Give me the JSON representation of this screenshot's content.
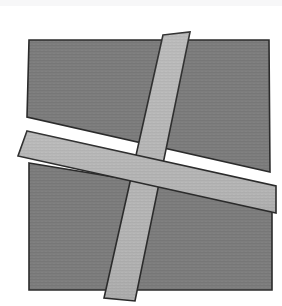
{
  "figure": {
    "canvas": {
      "width": 282,
      "height": 306,
      "background": "#ffffff"
    },
    "palette": {
      "background": "#ffffff",
      "panel_fill": "#7d7d7d",
      "panel_texture_line": "#747474",
      "band_fill": "#b4b4b4",
      "band_texture_line": "#aaaaaa",
      "outline": "#2b2b2b",
      "top_edge_artifact": "#f7f7f8"
    },
    "stroke_width": 1.6,
    "shapes": [
      {
        "name": "upper-panel",
        "role": "dark-quadrilateral",
        "fill": "#7d7d7d",
        "stroke": "#2b2b2b",
        "points": "29,40 269,40 270,172 27,117"
      },
      {
        "name": "lower-panel",
        "role": "dark-quadrilateral",
        "fill": "#7d7d7d",
        "stroke": "#2b2b2b",
        "points": "29,163 272,203 272,290 29,290"
      },
      {
        "name": "vertical-band",
        "role": "light-strip",
        "fill": "#b4b4b4",
        "stroke": "#2b2b2b",
        "points": "163,35 190,32 135,301 104,298"
      },
      {
        "name": "diagonal-band",
        "role": "light-strip",
        "fill": "#b4b4b4",
        "stroke": "#2b2b2b",
        "points": "27,131 276,186 276,213 18,156"
      }
    ],
    "draw_order": [
      "upper-panel",
      "lower-panel",
      "vertical-band",
      "diagonal-band"
    ]
  }
}
